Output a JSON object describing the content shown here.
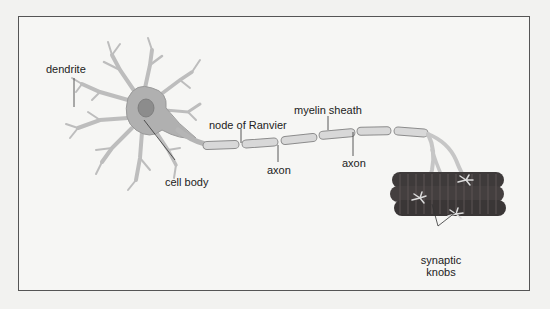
{
  "diagram": {
    "labels": {
      "dendrite": "dendrite",
      "cell_body": "cell body",
      "node_of_ranvier": "node of Ranvier",
      "myelin_sheath": "myelin sheath",
      "axon_1": "axon",
      "axon_2": "axon",
      "synaptic_knobs_line1": "synaptic",
      "synaptic_knobs_line2": "knobs"
    },
    "colors": {
      "background": "#f6f6f4",
      "frame_border": "#555555",
      "neuron_fill": "#c8c8c8",
      "cell_body_fill": "#a9a9a9",
      "nucleus_fill": "#8a8a8a",
      "myelin_fill": "#d6d6d6",
      "myelin_stroke": "#8a8a8a",
      "muscle_fill": "#3e3a3a",
      "muscle_stripe": "#5a5252",
      "leader_line": "#333333"
    }
  }
}
